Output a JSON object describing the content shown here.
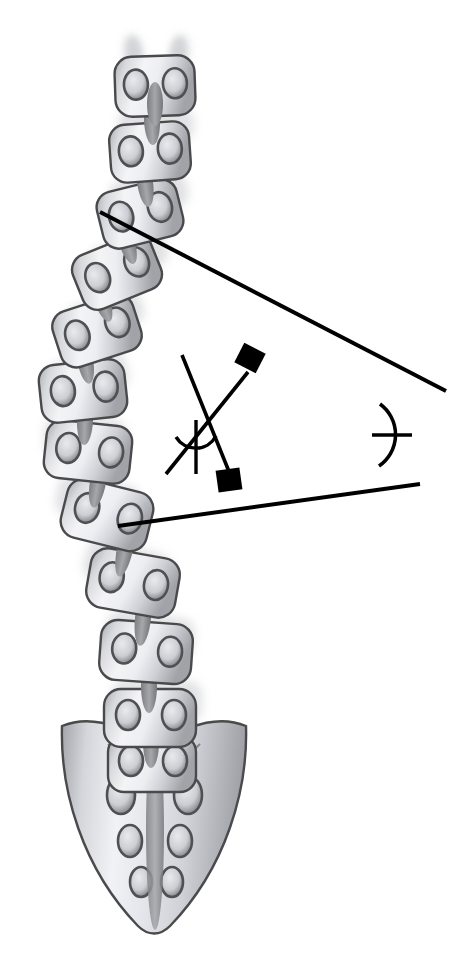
{
  "figure": {
    "type": "medical-illustration",
    "background_color": "#ffffff",
    "canvas": {
      "width": 468,
      "height": 967
    }
  },
  "palette": {
    "bone_light": "#f2f2f4",
    "bone_mid": "#c9cace",
    "bone_dark": "#9a9ba0",
    "bone_outline": "#4a4a4c",
    "disc": "#8c8d90",
    "foramen": "#5b5c5f",
    "shadow": "#d6d7da",
    "line": "#000000"
  },
  "spine": {
    "label": "scoliotic vertebral column",
    "vertebra_count": 12,
    "vertebrae": [
      {
        "id": "v1",
        "cx": 155,
        "cy": 86,
        "w": 80,
        "h": 60,
        "rot": -2,
        "label": "vertebra-1"
      },
      {
        "id": "v2",
        "cx": 150,
        "cy": 152,
        "w": 80,
        "h": 58,
        "rot": -4,
        "label": "vertebra-2"
      },
      {
        "id": "v3",
        "cx": 140,
        "cy": 214,
        "w": 82,
        "h": 58,
        "rot": -14,
        "label": "vertebra-3"
      },
      {
        "id": "v4",
        "cx": 117,
        "cy": 272,
        "w": 84,
        "h": 58,
        "rot": -22,
        "label": "vertebra-4"
      },
      {
        "id": "v5",
        "cx": 97,
        "cy": 331,
        "w": 84,
        "h": 58,
        "rot": -18,
        "label": "vertebra-5"
      },
      {
        "id": "v6",
        "cx": 83,
        "cy": 391,
        "w": 86,
        "h": 58,
        "rot": -6,
        "label": "vertebra-6"
      },
      {
        "id": "v7",
        "cx": 88,
        "cy": 452,
        "w": 86,
        "h": 58,
        "rot": 6,
        "label": "vertebra-7"
      },
      {
        "id": "v8",
        "cx": 107,
        "cy": 515,
        "w": 88,
        "h": 60,
        "rot": 14,
        "label": "vertebra-8"
      },
      {
        "id": "v9",
        "cx": 133,
        "cy": 583,
        "w": 90,
        "h": 60,
        "rot": 10,
        "label": "vertebra-9"
      },
      {
        "id": "v10",
        "cx": 146,
        "cy": 652,
        "w": 92,
        "h": 60,
        "rot": 4,
        "label": "vertebra-10"
      },
      {
        "id": "v11",
        "cx": 150,
        "cy": 718,
        "w": 92,
        "h": 58,
        "rot": 0,
        "label": "vertebra-11"
      },
      {
        "id": "v12",
        "cx": 152,
        "cy": 764,
        "w": 88,
        "h": 56,
        "rot": 0,
        "label": "vertebra-12"
      }
    ]
  },
  "sacrum": {
    "label": "sacrum",
    "foramina_count": 6,
    "apex_y": 930,
    "left_ala_x": 62,
    "right_ala_x": 246
  },
  "measurement": {
    "name": "Cobb angle",
    "upper_endplate_line": {
      "label": "superior end vertebra endplate line",
      "x1": 100,
      "y1": 212,
      "x2": 446,
      "y2": 391
    },
    "lower_endplate_line": {
      "label": "inferior end vertebra endplate line",
      "x1": 118,
      "y1": 526,
      "x2": 420,
      "y2": 484
    },
    "upper_perpendicular": {
      "label": "perpendicular to superior endplate",
      "x1": 182,
      "y1": 355,
      "x2": 232,
      "y2": 479
    },
    "lower_perpendicular": {
      "label": "perpendicular to inferior endplate",
      "x1": 248,
      "y1": 372,
      "x2": 166,
      "y2": 474
    },
    "right_angle_markers": [
      {
        "label": "right-angle-marker-upper",
        "cx": 249,
        "cy": 358,
        "size": 22,
        "rot": 27
      },
      {
        "label": "right-angle-marker-lower",
        "cx": 229,
        "cy": 480,
        "size": 22,
        "rot": -8
      }
    ],
    "angle_vertices": [
      {
        "label": "angle-vertex-perpendiculars",
        "cx": 196,
        "cy": 428,
        "radius": 28
      },
      {
        "label": "angle-vertex-endplates",
        "cx": 358,
        "cy": 435,
        "radius": 30
      }
    ]
  }
}
